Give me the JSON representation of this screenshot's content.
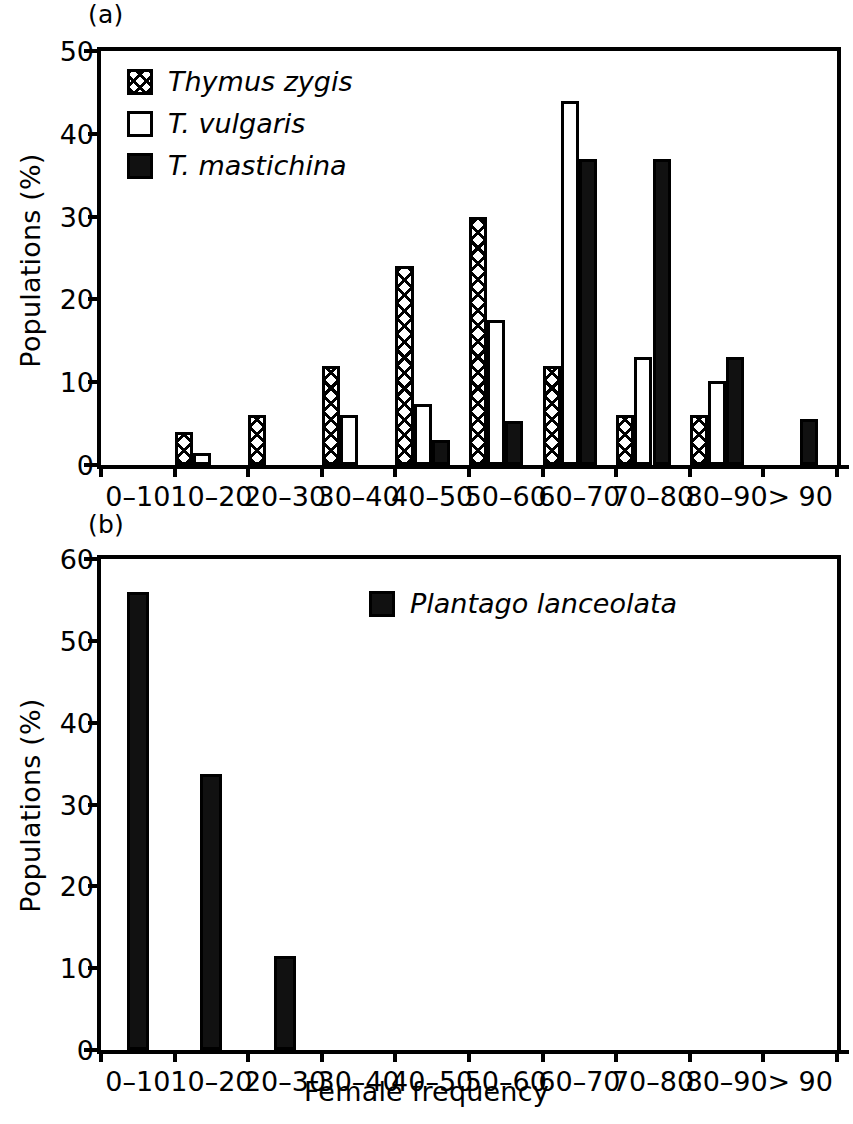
{
  "figure": {
    "xlabel": "Female frequency",
    "ylabel": "Populations (%)"
  },
  "panel_a": {
    "label": "(a)",
    "ylabel": "Populations (%)",
    "ytick_labels": [
      "50",
      "40",
      "30",
      "20",
      "10",
      "0"
    ],
    "legend": [
      {
        "name": "Thymus zygis",
        "pattern": "hatch"
      },
      {
        "name": "T. vulgaris",
        "pattern": "open"
      },
      {
        "name": "T. mastichina",
        "pattern": "solid"
      }
    ]
  },
  "panel_b": {
    "label": "(b)",
    "ylabel": "Populations (%)",
    "ytick_labels": [
      "60",
      "50",
      "40",
      "30",
      "20",
      "10",
      "0"
    ],
    "legend": [
      {
        "name": "Plantago lanceolata",
        "pattern": "solid"
      }
    ]
  },
  "chart_data": [
    {
      "panel": "(a)",
      "type": "bar",
      "title": "",
      "xlabel": "Female frequency",
      "ylabel": "Populations (%)",
      "ylim": [
        0,
        50
      ],
      "yticks": [
        0,
        10,
        20,
        30,
        40,
        50
      ],
      "grid": false,
      "legend_position": "top-left inside",
      "categories": [
        "0–10",
        "10–20",
        "20–30",
        "30–40",
        "40–50",
        "50–60",
        "60–70",
        "70–80",
        "80–90",
        "> 90"
      ],
      "series": [
        {
          "name": "Thymus zygis",
          "pattern": "hatch",
          "values": [
            0,
            4,
            6,
            12,
            24,
            30,
            12,
            6,
            6,
            0
          ]
        },
        {
          "name": "T. vulgaris",
          "pattern": "open",
          "values": [
            0,
            1.5,
            0,
            6,
            7.4,
            17.5,
            44,
            13,
            10.2,
            0
          ]
        },
        {
          "name": "T. mastichina",
          "pattern": "solid",
          "values": [
            0,
            0,
            0,
            0,
            3,
            5.3,
            37,
            37,
            13,
            5.5
          ]
        }
      ]
    },
    {
      "panel": "(b)",
      "type": "bar",
      "title": "",
      "xlabel": "Female frequency",
      "ylabel": "Populations (%)",
      "ylim": [
        0,
        60
      ],
      "yticks": [
        0,
        10,
        20,
        30,
        40,
        50,
        60
      ],
      "grid": false,
      "legend_position": "top-center inside",
      "categories": [
        "0–10",
        "10–20",
        "20–30",
        "30–40",
        "40–50",
        "50–60",
        "60–70",
        "70–80",
        "80–90",
        "> 90"
      ],
      "series": [
        {
          "name": "Plantago lanceolata",
          "pattern": "solid",
          "values": [
            56,
            33.7,
            11.5,
            0,
            0,
            0,
            0,
            0,
            0,
            0
          ]
        }
      ]
    }
  ]
}
